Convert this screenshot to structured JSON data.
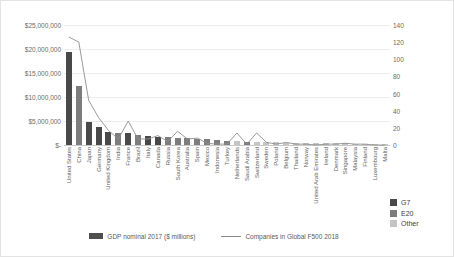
{
  "chart_data": {
    "type": "bar",
    "title": "",
    "xlabel": "",
    "ylabel": "",
    "ylim": [
      0,
      25000000
    ],
    "y2lim": [
      0,
      140
    ],
    "grid": true,
    "legend_position": "bottom",
    "y_ticks": [
      "$-",
      "$5,000,000",
      "$10,000,000",
      "$15,000,000",
      "$20,000,000",
      "$25,000,000"
    ],
    "y_tick_values": [
      0,
      5000000,
      10000000,
      15000000,
      20000000,
      25000000
    ],
    "y2_ticks": [
      "0",
      "20",
      "40",
      "60",
      "80",
      "100",
      "120",
      "140"
    ],
    "y2_tick_values": [
      0,
      20,
      40,
      60,
      80,
      100,
      120,
      140
    ],
    "categories": [
      "United States",
      "China",
      "Japan",
      "Germany",
      "United Kingdom",
      "India",
      "France",
      "Brazil",
      "Italy",
      "Canada",
      "Russia",
      "South Korea",
      "Australia",
      "Spain",
      "Mexico",
      "Indonesia",
      "Turkey",
      "Netherlands",
      "Saudi Arabia",
      "Switzerland",
      "Sweden",
      "Poland",
      "Belgium",
      "Thailand",
      "Norway",
      "United Arab Emirates",
      "Ireland",
      "Denmark",
      "Singapore",
      "Malaysia",
      "Finland",
      "Luxembourg",
      "Malta"
    ],
    "groups": [
      "G7",
      "E20",
      "G7",
      "G7",
      "G7",
      "E20",
      "G7",
      "E20",
      "G7",
      "G7",
      "E20",
      "E20",
      "E20",
      "E20",
      "E20",
      "E20",
      "E20",
      "Other",
      "E20",
      "Other",
      "Other",
      "Other",
      "Other",
      "Other",
      "Other",
      "Other",
      "Other",
      "Other",
      "Other",
      "Other",
      "Other",
      "Other",
      "Other"
    ],
    "series": [
      {
        "name": "GDP nominal 2017 ($ millions)",
        "type": "bar",
        "axis": "left",
        "values": [
          19390600,
          12237700,
          4872100,
          3677400,
          2622400,
          2597500,
          2582500,
          2055500,
          1934800,
          1640400,
          1577500,
          1538000,
          1379500,
          1311300,
          1149900,
          1015400,
          851500,
          826200,
          683800,
          678900,
          538000,
          524500,
          492700,
          455200,
          398800,
          382600,
          333700,
          324900,
          323900,
          314500,
          251900,
          62400,
          12500
        ]
      },
      {
        "name": "Companies in Global F500 2018",
        "type": "line",
        "axis": "right",
        "values": [
          126,
          120,
          52,
          32,
          17,
          7,
          28,
          7,
          7,
          11,
          4,
          16,
          7,
          8,
          2,
          1,
          1,
          14,
          1,
          14,
          3,
          1,
          3,
          1,
          1,
          0,
          1,
          1,
          2,
          1,
          1,
          0,
          0
        ]
      }
    ],
    "category_legend": [
      {
        "label": "G7",
        "color": "#494949"
      },
      {
        "label": "E20",
        "color": "#7d7d7d"
      },
      {
        "label": "Other",
        "color": "#c4c4c4"
      }
    ]
  }
}
